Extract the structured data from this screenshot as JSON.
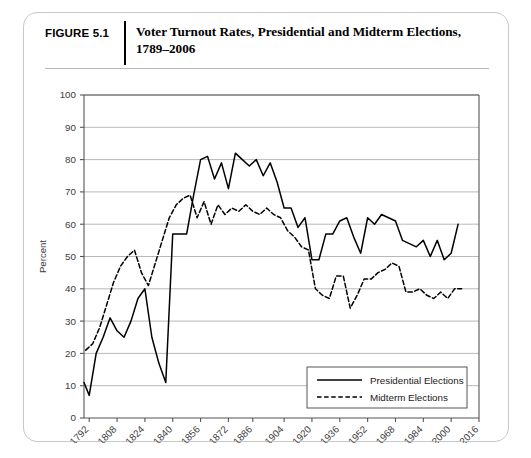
{
  "figure": {
    "number_label": "FIGURE 5.1",
    "title": "Voter Turnout Rates, Presidential and Midterm Elections, 1789–2006"
  },
  "chart_data": {
    "type": "line",
    "title": "Voter Turnout Rates, Presidential and Midterm Elections, 1789–2006",
    "xlabel": "",
    "ylabel": "Percent",
    "xlim": [
      1789,
      2016
    ],
    "ylim": [
      0,
      100
    ],
    "ytick_values": [
      0,
      10,
      20,
      30,
      40,
      50,
      60,
      70,
      80,
      90,
      100
    ],
    "xtick_values": [
      1792,
      1808,
      1824,
      1840,
      1856,
      1872,
      1886,
      1904,
      1920,
      1936,
      1952,
      1968,
      1984,
      2000,
      2016
    ],
    "xtick_labels": [
      "1792",
      "1808",
      "1824",
      "1840",
      "1856",
      "1872",
      "1886",
      "1904",
      "1920",
      "1936",
      "1952",
      "1968",
      "1984",
      "2000",
      "2016"
    ],
    "grid": "horizontal",
    "legend_position": "bottom-right",
    "colors": {
      "line": "#000000",
      "grid": "#b0b0b0",
      "axis": "#555555",
      "frame": "#c8c8c8"
    },
    "series": [
      {
        "name": "Presidential Elections",
        "style": "solid",
        "x": [
          1789,
          1792,
          1796,
          1800,
          1804,
          1808,
          1812,
          1816,
          1820,
          1824,
          1828,
          1832,
          1836,
          1840,
          1844,
          1848,
          1852,
          1856,
          1860,
          1864,
          1868,
          1872,
          1876,
          1880,
          1884,
          1888,
          1892,
          1896,
          1900,
          1904,
          1908,
          1912,
          1916,
          1920,
          1924,
          1928,
          1932,
          1936,
          1940,
          1944,
          1948,
          1952,
          1956,
          1960,
          1964,
          1968,
          1972,
          1976,
          1980,
          1984,
          1988,
          1992,
          1996,
          2000,
          2004
        ],
        "values": [
          11,
          7,
          20,
          25,
          31,
          27,
          25,
          30,
          37,
          40,
          25,
          17,
          11,
          57,
          57,
          57,
          69,
          80,
          81,
          74,
          79,
          71,
          82,
          80,
          78,
          80,
          75,
          79,
          73,
          65,
          65,
          59,
          62,
          49,
          49,
          57,
          57,
          61,
          62,
          56,
          51,
          62,
          60,
          63,
          62,
          61,
          55,
          54,
          53,
          55,
          50,
          55,
          49,
          51,
          60
        ]
      },
      {
        "name": "Midterm Elections",
        "style": "dashed",
        "x": [
          1790,
          1794,
          1798,
          1802,
          1806,
          1810,
          1814,
          1818,
          1822,
          1826,
          1830,
          1834,
          1838,
          1842,
          1846,
          1850,
          1854,
          1858,
          1862,
          1866,
          1870,
          1874,
          1878,
          1882,
          1886,
          1890,
          1894,
          1898,
          1902,
          1906,
          1910,
          1914,
          1918,
          1922,
          1926,
          1930,
          1934,
          1938,
          1942,
          1946,
          1950,
          1954,
          1958,
          1962,
          1966,
          1970,
          1974,
          1978,
          1982,
          1986,
          1990,
          1994,
          1998,
          2002,
          2006
        ],
        "values": [
          21,
          23,
          28,
          35,
          42,
          47,
          50,
          52,
          45,
          41,
          48,
          55,
          62,
          66,
          68,
          69,
          62,
          67,
          60,
          66,
          63,
          65,
          64,
          66,
          64,
          63,
          65,
          63,
          62,
          58,
          56,
          53,
          52,
          40,
          38,
          37,
          44,
          44,
          34,
          38,
          43,
          43,
          45,
          46,
          48,
          47,
          39,
          39,
          40,
          38,
          37,
          39,
          37,
          40,
          40
        ]
      }
    ]
  },
  "legend": {
    "entries": [
      {
        "label": "Presidential Elections",
        "style": "solid"
      },
      {
        "label": "Midterm Elections",
        "style": "dashed"
      }
    ]
  }
}
